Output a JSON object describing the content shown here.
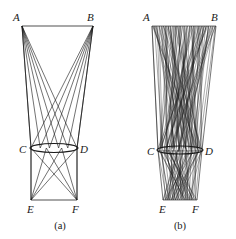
{
  "figure": {
    "background_color": "#ffffff",
    "ink_color": "#1a1a1a",
    "width": 236,
    "height": 239,
    "panels": [
      {
        "id": "panel-a",
        "caption": "(a)",
        "caption_pos": [
          60,
          229
        ],
        "line_density": "sparse",
        "ray_count": 6,
        "vertices": {
          "A": {
            "label": "A",
            "point": [
              22,
              26
            ],
            "label_pos": [
              13,
              21
            ]
          },
          "B": {
            "label": "B",
            "point": [
              93,
              26
            ],
            "label_pos": [
              87,
              21
            ]
          },
          "C": {
            "label": "C",
            "point": [
              31,
              148
            ],
            "label_pos": [
              19,
              153
            ]
          },
          "D": {
            "label": "D",
            "point": [
              77,
              148
            ],
            "label_pos": [
              80,
              153
            ]
          },
          "E": {
            "label": "E",
            "point": [
              31,
              200
            ],
            "label_pos": [
              27,
              213
            ]
          },
          "F": {
            "label": "F",
            "point": [
              77,
              200
            ],
            "label_pos": [
              72,
              213
            ]
          }
        },
        "ellipse": {
          "cx": 54,
          "cy": 148,
          "rx": 24,
          "ry": 4.5
        }
      },
      {
        "id": "panel-b",
        "caption": "(b)",
        "caption_pos": [
          180,
          229
        ],
        "line_density": "dense",
        "ray_count": 30,
        "vertices": {
          "A": {
            "label": "A",
            "point": [
              152,
              26
            ],
            "label_pos": [
              143,
              21
            ]
          },
          "B": {
            "label": "B",
            "point": [
              216,
              26
            ],
            "label_pos": [
              211,
              21
            ]
          },
          "C": {
            "label": "C",
            "point": [
              158,
              150
            ],
            "label_pos": [
              147,
              155
            ]
          },
          "D": {
            "label": "D",
            "point": [
              202,
              150
            ],
            "label_pos": [
              205,
              155
            ]
          },
          "E": {
            "label": "E",
            "point": [
              163,
              200
            ],
            "label_pos": [
              159,
              213
            ]
          },
          "F": {
            "label": "F",
            "point": [
              197,
              200
            ],
            "label_pos": [
              192,
              213
            ]
          }
        },
        "ellipse": {
          "cx": 180,
          "cy": 150,
          "rx": 23,
          "ry": 4.0
        }
      }
    ]
  }
}
